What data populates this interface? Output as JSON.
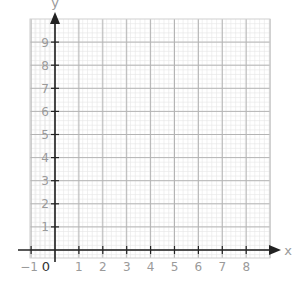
{
  "chart_data": {
    "type": "scatter",
    "title": "",
    "xlabel": "x",
    "ylabel": "y",
    "xlim": [
      -1,
      9
    ],
    "ylim": [
      0,
      9.5
    ],
    "x_ticks": [
      "-1",
      "1",
      "2",
      "3",
      "4",
      "5",
      "6",
      "7",
      "8"
    ],
    "y_ticks": [
      "1",
      "2",
      "3",
      "4",
      "5",
      "6",
      "7",
      "8",
      "9"
    ],
    "origin_label": "0",
    "grid": true,
    "minor_grid": true,
    "series": [],
    "colors": {
      "major_grid": "#b4b4b4",
      "minor_grid": "#e6e6e6",
      "axis": "#222222",
      "tick_label": "#9a9a9a"
    }
  }
}
